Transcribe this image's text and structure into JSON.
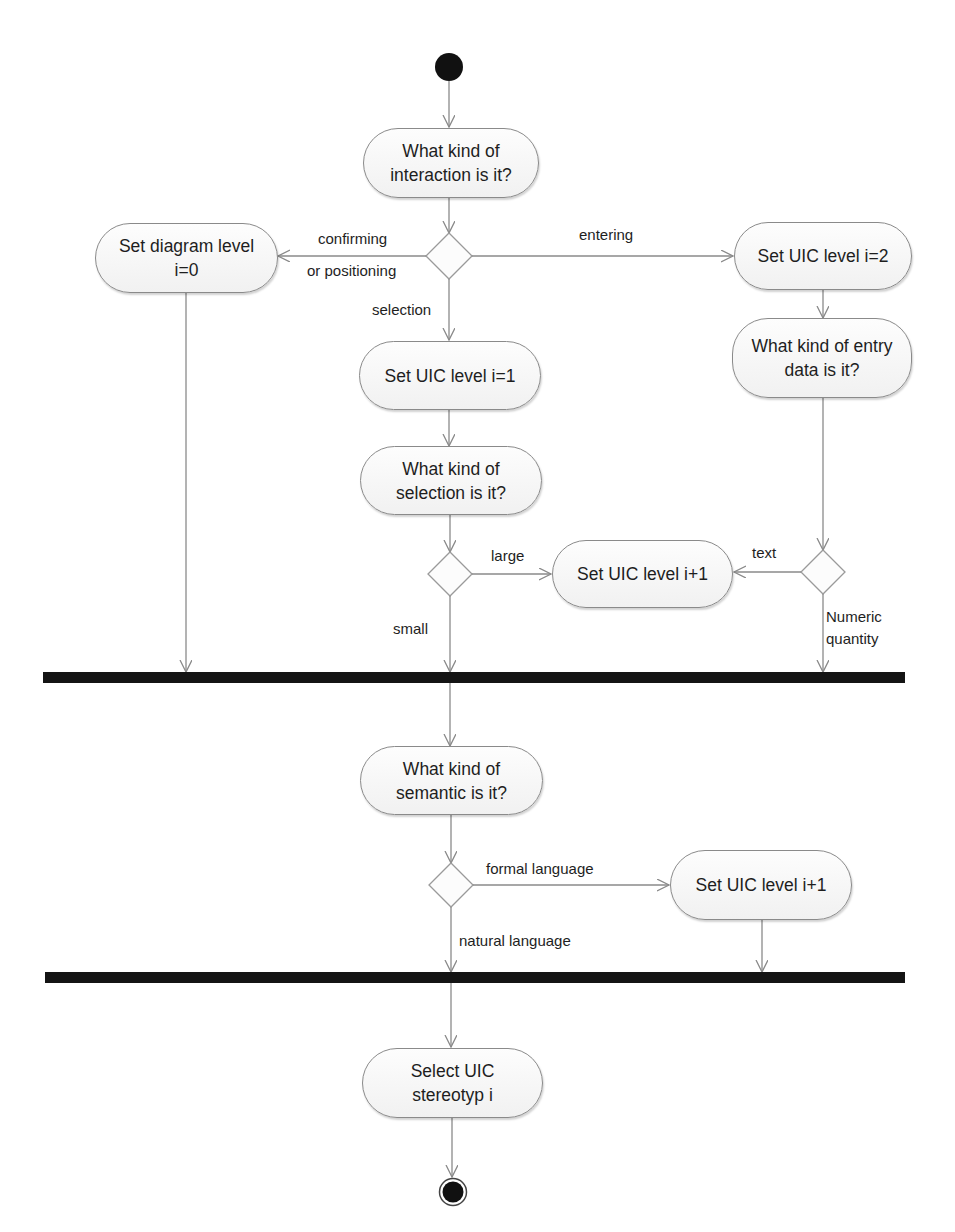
{
  "diagram": {
    "type": "UML activity diagram",
    "start_node": "initial-node",
    "end_node": "final-node",
    "nodes": {
      "interaction_kind": "What kind of\ninteraction is it?",
      "set_diagram_level": "Set diagram level\ni=0",
      "set_uic_level_2": "Set UIC level i=2",
      "set_uic_level_1": "Set UIC level i=1",
      "entry_data_kind": "What kind of entry\ndata is it?",
      "selection_kind": "What kind of\nselection is it?",
      "set_uic_level_inc_a": "Set UIC level i+1",
      "semantic_kind": "What kind of\nsemantic is it?",
      "set_uic_level_inc_b": "Set UIC level i+1",
      "select_stereotype": "Select UIC\nstereotyp i"
    },
    "edge_labels": {
      "confirming": "confirming",
      "or_positioning": "or positioning",
      "entering": "entering",
      "selection": "selection",
      "large": "large",
      "small": "small",
      "text": "text",
      "numeric_quantity": "Numeric\nquantity",
      "formal_language": "formal language",
      "natural_language": "natural language"
    },
    "colors": {
      "line": "#8a8a8a",
      "bar": "#141414",
      "node_fill": "#f6f6f6",
      "initial": "#111111"
    }
  }
}
